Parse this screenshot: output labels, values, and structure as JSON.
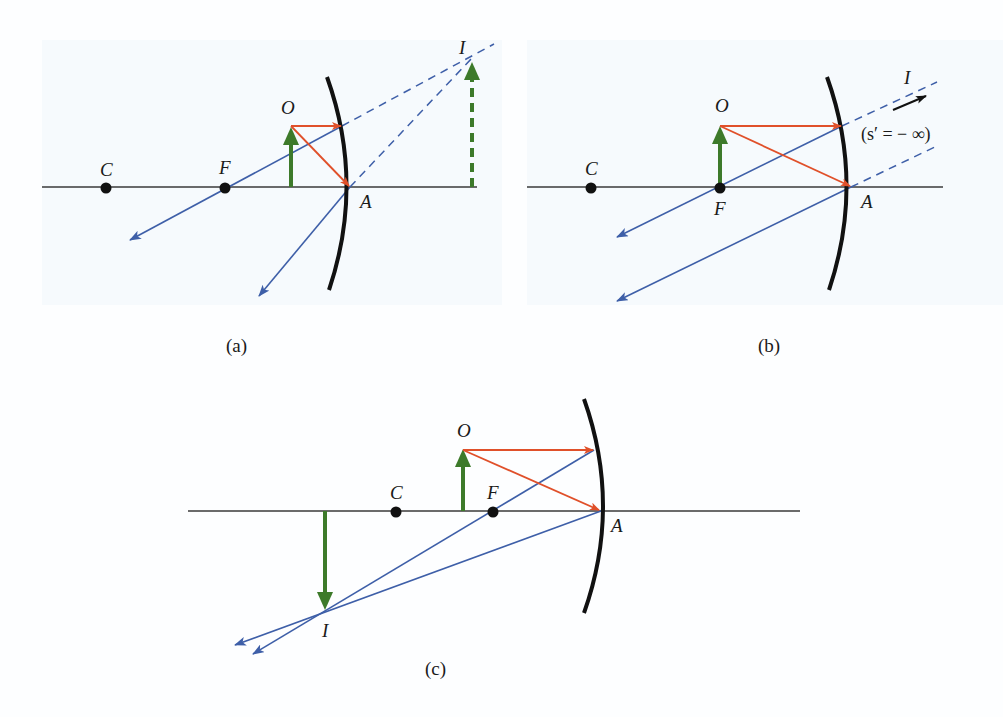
{
  "figure": {
    "colors": {
      "axis": "#3a3a3a",
      "mirror": "#111111",
      "object": "#3d7a2a",
      "incident_ray": "#e0502a",
      "reflected_ray": "#3e5fa8",
      "point": "#111111"
    },
    "panels": [
      {
        "id": "a",
        "caption": "(a)",
        "labels": {
          "center": "C",
          "focus": "F",
          "object": "O",
          "vertex": "A",
          "image": "I"
        },
        "image_type": "virtual, upright (dashed)"
      },
      {
        "id": "b",
        "caption": "(b)",
        "labels": {
          "center": "C",
          "focus": "F",
          "object": "O",
          "vertex": "A",
          "image": "I"
        },
        "annotation": "(s′ = − ∞)",
        "image_type": "at infinity"
      },
      {
        "id": "c",
        "caption": "(c)",
        "labels": {
          "center": "C",
          "focus": "F",
          "object": "O",
          "vertex": "A",
          "image": "I"
        },
        "image_type": "real, inverted"
      }
    ]
  }
}
